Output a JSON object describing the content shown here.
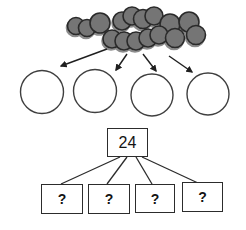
{
  "diagram": {
    "background": "#ffffff",
    "counter_pile": {
      "icon": "counter-circle-icon",
      "fill": "#757575",
      "stroke": "#2b2b2b",
      "counters": [
        {
          "cx": 76,
          "cy": 26,
          "r": 8.5
        },
        {
          "cx": 87,
          "cy": 28,
          "r": 8.5
        },
        {
          "cx": 100,
          "cy": 23,
          "r": 10
        },
        {
          "cx": 122,
          "cy": 21,
          "r": 9
        },
        {
          "cx": 132,
          "cy": 16,
          "r": 9
        },
        {
          "cx": 143,
          "cy": 19,
          "r": 9.5
        },
        {
          "cx": 154,
          "cy": 16,
          "r": 9
        },
        {
          "cx": 170,
          "cy": 24,
          "r": 10
        },
        {
          "cx": 189,
          "cy": 22,
          "r": 10
        },
        {
          "cx": 112,
          "cy": 39,
          "r": 9
        },
        {
          "cx": 124,
          "cy": 41,
          "r": 9
        },
        {
          "cx": 136,
          "cy": 41,
          "r": 9
        },
        {
          "cx": 148,
          "cy": 38,
          "r": 9
        },
        {
          "cx": 159,
          "cy": 35,
          "r": 9
        },
        {
          "cx": 175,
          "cy": 38,
          "r": 9.5
        },
        {
          "cx": 196,
          "cy": 35,
          "r": 9.5
        }
      ]
    },
    "arrows": {
      "color": "#1f1f1f",
      "items": [
        {
          "x1": 107,
          "y1": 49,
          "x2": 61,
          "y2": 66
        },
        {
          "x1": 127,
          "y1": 54,
          "x2": 116,
          "y2": 70
        },
        {
          "x1": 143,
          "y1": 54,
          "x2": 156,
          "y2": 71
        },
        {
          "x1": 169,
          "y1": 56,
          "x2": 192,
          "y2": 72
        }
      ]
    },
    "group_circles": {
      "stroke": "#3f3f3f",
      "fill": "#ffffff",
      "items": [
        {
          "cx": 42,
          "cy": 92,
          "r": 21.5
        },
        {
          "cx": 95,
          "cy": 91,
          "r": 21.5
        },
        {
          "cx": 152,
          "cy": 95,
          "r": 21
        },
        {
          "cx": 208,
          "cy": 94,
          "r": 21
        }
      ]
    },
    "tree": {
      "link_color": "#2c2c2c",
      "total_box": {
        "label": "24",
        "x": 107,
        "y": 128,
        "w": 41,
        "h": 29
      },
      "links": [
        {
          "x1": 120,
          "y1": 157,
          "x2": 61,
          "y2": 184
        },
        {
          "x1": 127,
          "y1": 157,
          "x2": 107,
          "y2": 184
        },
        {
          "x1": 136,
          "y1": 157,
          "x2": 152,
          "y2": 184
        },
        {
          "x1": 142,
          "y1": 157,
          "x2": 198,
          "y2": 183
        }
      ],
      "part_boxes": [
        {
          "label": "?",
          "x": 41,
          "y": 184,
          "w": 42,
          "h": 30
        },
        {
          "label": "?",
          "x": 88,
          "y": 184,
          "w": 42,
          "h": 30
        },
        {
          "label": "?",
          "x": 135,
          "y": 184,
          "w": 40,
          "h": 29
        },
        {
          "label": "?",
          "x": 182,
          "y": 182,
          "w": 41,
          "h": 30
        }
      ]
    }
  }
}
